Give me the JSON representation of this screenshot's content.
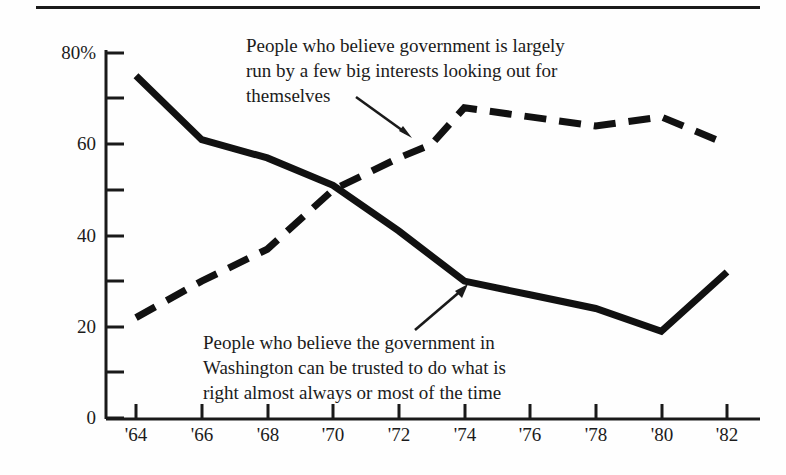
{
  "figure": {
    "top_rule": "horizontal-rule"
  },
  "annotations": {
    "series_big_interests": "People who believe government is largely\nrun by a few big interests looking out for\nthemselves",
    "series_trust": "People who believe the government in\nWashington can be trusted to do what is\nright almost always or most of the time"
  },
  "axes": {
    "y_ticks": [
      "80%",
      "60",
      "40",
      "20",
      "0"
    ],
    "x_ticks": [
      "'64",
      "'66",
      "'68",
      "'70",
      "'72",
      "'74",
      "'76",
      "'78",
      "'80",
      "'82"
    ]
  },
  "chart_data": {
    "type": "line",
    "title": "",
    "subtitle": "",
    "xlabel": "",
    "ylabel": "",
    "xlim": [
      1964,
      1982
    ],
    "ylim": [
      0,
      80
    ],
    "grid": false,
    "legend_position": "inline-annotations",
    "x": [
      1964,
      1966,
      1968,
      1970,
      1972,
      1974,
      1976,
      1978,
      1980,
      1982
    ],
    "y_axis_tick_values": [
      0,
      10,
      20,
      30,
      40,
      50,
      60,
      70,
      80
    ],
    "y_axis_major_labels": [
      0,
      20,
      40,
      60,
      80
    ],
    "y_axis_minor_ticks": [
      10,
      30,
      50,
      70
    ],
    "y_axis_unit": "percent",
    "series": [
      {
        "name": "People who believe government is largely run by a few big interests looking out for themselves",
        "style": "dashed",
        "color": "#111111",
        "values": [
          22,
          30,
          37,
          50,
          57,
          68,
          66,
          64,
          66,
          60
        ]
      },
      {
        "name": "People who believe the government in Washington can be trusted to do what is right almost always or most of the time",
        "style": "solid",
        "color": "#111111",
        "values": [
          75,
          61,
          57,
          51,
          41,
          30,
          27,
          24,
          19,
          32
        ]
      }
    ],
    "annotations": [
      {
        "text": "People who believe government is largely run by a few big interests looking out for themselves",
        "points_to_series": "dashed",
        "points_to_x": 1973
      },
      {
        "text": "People who believe the government in Washington can be trusted to do what is right almost always or most of the time",
        "points_to_series": "solid",
        "points_to_x": 1974
      }
    ]
  }
}
